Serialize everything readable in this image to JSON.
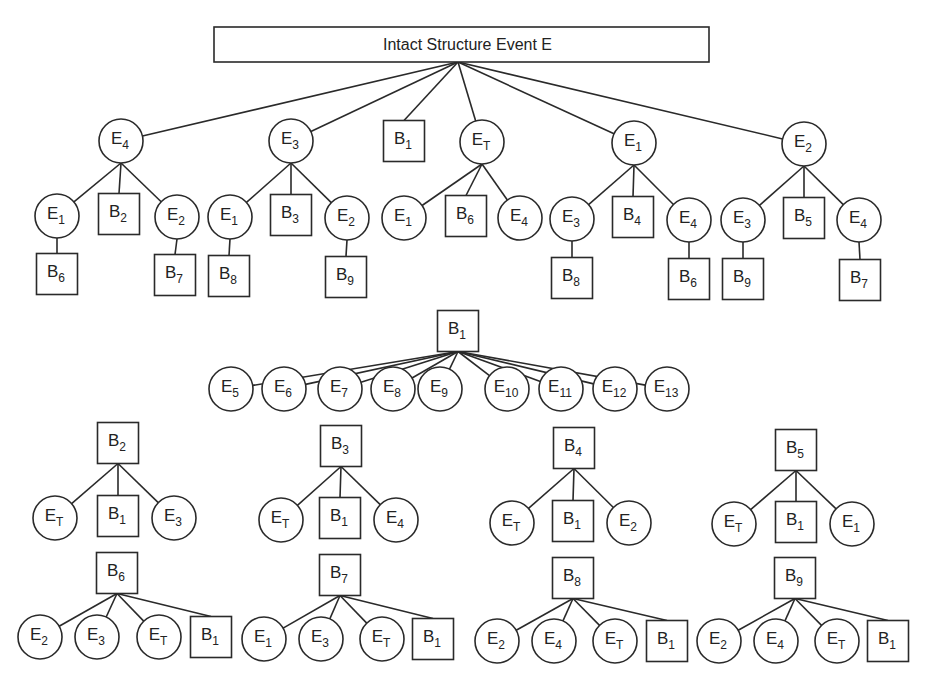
{
  "title": "Intact Structure Event E",
  "colors": {
    "stroke": "#2a2a2a",
    "background": "#ffffff"
  },
  "root": {
    "x": 214,
    "y": 27,
    "w": 495,
    "h": 35,
    "anchor": [
      458,
      62
    ]
  },
  "nodes": [
    {
      "id": "l1_E4",
      "shape": "circle",
      "base": "E",
      "sub": "4",
      "x": 121,
      "y": 141
    },
    {
      "id": "l1_E3",
      "shape": "circle",
      "base": "E",
      "sub": "3",
      "x": 291,
      "y": 141
    },
    {
      "id": "l1_B1",
      "shape": "box",
      "base": "B",
      "sub": "1",
      "x": 404,
      "y": 141
    },
    {
      "id": "l1_ET",
      "shape": "circle",
      "base": "E",
      "sub": "T",
      "x": 482,
      "y": 142
    },
    {
      "id": "l1_E1",
      "shape": "circle",
      "base": "E",
      "sub": "1",
      "x": 634,
      "y": 143
    },
    {
      "id": "l1_E2",
      "shape": "circle",
      "base": "E",
      "sub": "2",
      "x": 804,
      "y": 144
    },
    {
      "id": "a_E1",
      "shape": "circle",
      "base": "E",
      "sub": "1",
      "x": 57,
      "y": 216
    },
    {
      "id": "a_B2",
      "shape": "box",
      "base": "B",
      "sub": "2",
      "x": 119,
      "y": 214
    },
    {
      "id": "a_E2",
      "shape": "circle",
      "base": "E",
      "sub": "2",
      "x": 177,
      "y": 217
    },
    {
      "id": "a_B6",
      "shape": "box",
      "base": "B",
      "sub": "6",
      "x": 57,
      "y": 274
    },
    {
      "id": "a_B7",
      "shape": "box",
      "base": "B",
      "sub": "7",
      "x": 175,
      "y": 275
    },
    {
      "id": "b_E1",
      "shape": "circle",
      "base": "E",
      "sub": "1",
      "x": 230,
      "y": 217
    },
    {
      "id": "b_B3",
      "shape": "box",
      "base": "B",
      "sub": "3",
      "x": 291,
      "y": 215
    },
    {
      "id": "b_E2",
      "shape": "circle",
      "base": "E",
      "sub": "2",
      "x": 347,
      "y": 218
    },
    {
      "id": "b_B8",
      "shape": "box",
      "base": "B",
      "sub": "8",
      "x": 229,
      "y": 276
    },
    {
      "id": "b_B9",
      "shape": "box",
      "base": "B",
      "sub": "9",
      "x": 346,
      "y": 277
    },
    {
      "id": "c_E1",
      "shape": "circle",
      "base": "E",
      "sub": "1",
      "x": 404,
      "y": 218
    },
    {
      "id": "c_B6",
      "shape": "box",
      "base": "B",
      "sub": "6",
      "x": 466,
      "y": 216
    },
    {
      "id": "c_E4",
      "shape": "circle",
      "base": "E",
      "sub": "4",
      "x": 520,
      "y": 218
    },
    {
      "id": "d_E3",
      "shape": "circle",
      "base": "E",
      "sub": "3",
      "x": 572,
      "y": 219
    },
    {
      "id": "d_B4",
      "shape": "box",
      "base": "B",
      "sub": "4",
      "x": 633,
      "y": 217
    },
    {
      "id": "d_E4",
      "shape": "circle",
      "base": "E",
      "sub": "4",
      "x": 689,
      "y": 220
    },
    {
      "id": "d_B8",
      "shape": "box",
      "base": "B",
      "sub": "8",
      "x": 572,
      "y": 278
    },
    {
      "id": "d_B6",
      "shape": "box",
      "base": "B",
      "sub": "6",
      "x": 689,
      "y": 279
    },
    {
      "id": "e_E3",
      "shape": "circle",
      "base": "E",
      "sub": "3",
      "x": 743,
      "y": 220
    },
    {
      "id": "e_B5",
      "shape": "box",
      "base": "B",
      "sub": "5",
      "x": 804,
      "y": 218
    },
    {
      "id": "e_E4",
      "shape": "circle",
      "base": "E",
      "sub": "4",
      "x": 859,
      "y": 220
    },
    {
      "id": "e_B9",
      "shape": "box",
      "base": "B",
      "sub": "9",
      "x": 743,
      "y": 279
    },
    {
      "id": "e_B7",
      "shape": "box",
      "base": "B",
      "sub": "7",
      "x": 860,
      "y": 280
    },
    {
      "id": "f_B1",
      "shape": "box",
      "base": "B",
      "sub": "1",
      "x": 458,
      "y": 331
    },
    {
      "id": "f_E5",
      "shape": "circle",
      "base": "E",
      "sub": "5",
      "x": 231,
      "y": 389
    },
    {
      "id": "f_E6",
      "shape": "circle",
      "base": "E",
      "sub": "6",
      "x": 284,
      "y": 389
    },
    {
      "id": "f_E7",
      "shape": "circle",
      "base": "E",
      "sub": "7",
      "x": 340,
      "y": 389
    },
    {
      "id": "f_E8",
      "shape": "circle",
      "base": "E",
      "sub": "8",
      "x": 393,
      "y": 389
    },
    {
      "id": "f_E9",
      "shape": "circle",
      "base": "E",
      "sub": "9",
      "x": 440,
      "y": 389
    },
    {
      "id": "f_E10",
      "shape": "circle",
      "base": "E",
      "sub": "10",
      "x": 507,
      "y": 389
    },
    {
      "id": "f_E11",
      "shape": "circle",
      "base": "E",
      "sub": "11",
      "x": 561,
      "y": 389
    },
    {
      "id": "f_E12",
      "shape": "circle",
      "base": "E",
      "sub": "12",
      "x": 615,
      "y": 389
    },
    {
      "id": "f_E13",
      "shape": "circle",
      "base": "E",
      "sub": "13",
      "x": 667,
      "y": 389
    },
    {
      "id": "g_B2",
      "shape": "box",
      "base": "B",
      "sub": "2",
      "x": 118,
      "y": 443
    },
    {
      "id": "g_ET",
      "shape": "circle",
      "base": "E",
      "sub": "T",
      "x": 55,
      "y": 518
    },
    {
      "id": "g_B1",
      "shape": "box",
      "base": "B",
      "sub": "1",
      "x": 118,
      "y": 516
    },
    {
      "id": "g_E3",
      "shape": "circle",
      "base": "E",
      "sub": "3",
      "x": 174,
      "y": 518
    },
    {
      "id": "h_B3",
      "shape": "box",
      "base": "B",
      "sub": "3",
      "x": 341,
      "y": 446
    },
    {
      "id": "h_ET",
      "shape": "circle",
      "base": "E",
      "sub": "T",
      "x": 281,
      "y": 520
    },
    {
      "id": "h_B1",
      "shape": "box",
      "base": "B",
      "sub": "1",
      "x": 340,
      "y": 518
    },
    {
      "id": "h_E4",
      "shape": "circle",
      "base": "E",
      "sub": "4",
      "x": 396,
      "y": 520
    },
    {
      "id": "i_B4",
      "shape": "box",
      "base": "B",
      "sub": "4",
      "x": 574,
      "y": 448
    },
    {
      "id": "i_ET",
      "shape": "circle",
      "base": "E",
      "sub": "T",
      "x": 512,
      "y": 523
    },
    {
      "id": "i_B1",
      "shape": "box",
      "base": "B",
      "sub": "1",
      "x": 573,
      "y": 521
    },
    {
      "id": "i_E2",
      "shape": "circle",
      "base": "E",
      "sub": "2",
      "x": 629,
      "y": 523
    },
    {
      "id": "j_B5",
      "shape": "box",
      "base": "B",
      "sub": "5",
      "x": 796,
      "y": 450
    },
    {
      "id": "j_ET",
      "shape": "circle",
      "base": "E",
      "sub": "T",
      "x": 734,
      "y": 524
    },
    {
      "id": "j_B1",
      "shape": "box",
      "base": "B",
      "sub": "1",
      "x": 796,
      "y": 522
    },
    {
      "id": "j_E1",
      "shape": "circle",
      "base": "E",
      "sub": "1",
      "x": 852,
      "y": 524
    },
    {
      "id": "k_B6",
      "shape": "box",
      "base": "B",
      "sub": "6",
      "x": 117,
      "y": 573
    },
    {
      "id": "k_E2",
      "shape": "circle",
      "base": "E",
      "sub": "2",
      "x": 40,
      "y": 637
    },
    {
      "id": "k_E3",
      "shape": "circle",
      "base": "E",
      "sub": "3",
      "x": 97,
      "y": 637
    },
    {
      "id": "k_ET",
      "shape": "circle",
      "base": "E",
      "sub": "T",
      "x": 159,
      "y": 637
    },
    {
      "id": "k_B1",
      "shape": "box",
      "base": "B",
      "sub": "1",
      "x": 211,
      "y": 637
    },
    {
      "id": "l_B7",
      "shape": "box",
      "base": "B",
      "sub": "7",
      "x": 340,
      "y": 575
    },
    {
      "id": "l_E1",
      "shape": "circle",
      "base": "E",
      "sub": "1",
      "x": 264,
      "y": 639
    },
    {
      "id": "l_E3",
      "shape": "circle",
      "base": "E",
      "sub": "3",
      "x": 321,
      "y": 639
    },
    {
      "id": "l_ET",
      "shape": "circle",
      "base": "E",
      "sub": "T",
      "x": 382,
      "y": 639
    },
    {
      "id": "l_B1",
      "shape": "box",
      "base": "B",
      "sub": "1",
      "x": 433,
      "y": 639
    },
    {
      "id": "m_B8",
      "shape": "box",
      "base": "B",
      "sub": "8",
      "x": 573,
      "y": 578
    },
    {
      "id": "m_E2",
      "shape": "circle",
      "base": "E",
      "sub": "2",
      "x": 497,
      "y": 641
    },
    {
      "id": "m_E4",
      "shape": "circle",
      "base": "E",
      "sub": "4",
      "x": 554,
      "y": 641
    },
    {
      "id": "m_ET",
      "shape": "circle",
      "base": "E",
      "sub": "T",
      "x": 615,
      "y": 641
    },
    {
      "id": "m_B1",
      "shape": "box",
      "base": "B",
      "sub": "1",
      "x": 667,
      "y": 641
    },
    {
      "id": "n_B9",
      "shape": "box",
      "base": "B",
      "sub": "9",
      "x": 795,
      "y": 578
    },
    {
      "id": "n_E2",
      "shape": "circle",
      "base": "E",
      "sub": "2",
      "x": 719,
      "y": 641
    },
    {
      "id": "n_E4",
      "shape": "circle",
      "base": "E",
      "sub": "4",
      "x": 776,
      "y": 641
    },
    {
      "id": "n_ET",
      "shape": "circle",
      "base": "E",
      "sub": "T",
      "x": 837,
      "y": 641
    },
    {
      "id": "n_B1",
      "shape": "box",
      "base": "B",
      "sub": "1",
      "x": 888,
      "y": 641
    }
  ],
  "edges": [
    [
      "root",
      "l1_E4"
    ],
    [
      "root",
      "l1_E3"
    ],
    [
      "root",
      "l1_B1"
    ],
    [
      "root",
      "l1_ET"
    ],
    [
      "root",
      "l1_E1"
    ],
    [
      "root",
      "l1_E2"
    ],
    [
      "l1_E4",
      "a_E1"
    ],
    [
      "l1_E4",
      "a_B2"
    ],
    [
      "l1_E4",
      "a_E2"
    ],
    [
      "a_E1",
      "a_B6"
    ],
    [
      "a_E2",
      "a_B7"
    ],
    [
      "l1_E3",
      "b_E1"
    ],
    [
      "l1_E3",
      "b_B3"
    ],
    [
      "l1_E3",
      "b_E2"
    ],
    [
      "b_E1",
      "b_B8"
    ],
    [
      "b_E2",
      "b_B9"
    ],
    [
      "l1_ET",
      "c_E1"
    ],
    [
      "l1_ET",
      "c_B6"
    ],
    [
      "l1_ET",
      "c_E4"
    ],
    [
      "l1_E1",
      "d_E3"
    ],
    [
      "l1_E1",
      "d_B4"
    ],
    [
      "l1_E1",
      "d_E4"
    ],
    [
      "d_E3",
      "d_B8"
    ],
    [
      "d_E4",
      "d_B6"
    ],
    [
      "l1_E2",
      "e_E3"
    ],
    [
      "l1_E2",
      "e_B5"
    ],
    [
      "l1_E2",
      "e_E4"
    ],
    [
      "e_E3",
      "e_B9"
    ],
    [
      "e_E4",
      "e_B7"
    ],
    [
      "f_B1",
      "f_E5"
    ],
    [
      "f_B1",
      "f_E6"
    ],
    [
      "f_B1",
      "f_E7"
    ],
    [
      "f_B1",
      "f_E8"
    ],
    [
      "f_B1",
      "f_E9"
    ],
    [
      "f_B1",
      "f_E10"
    ],
    [
      "f_B1",
      "f_E11"
    ],
    [
      "f_B1",
      "f_E12"
    ],
    [
      "f_B1",
      "f_E13"
    ],
    [
      "g_B2",
      "g_ET"
    ],
    [
      "g_B2",
      "g_B1"
    ],
    [
      "g_B2",
      "g_E3"
    ],
    [
      "h_B3",
      "h_ET"
    ],
    [
      "h_B3",
      "h_B1"
    ],
    [
      "h_B3",
      "h_E4"
    ],
    [
      "i_B4",
      "i_ET"
    ],
    [
      "i_B4",
      "i_B1"
    ],
    [
      "i_B4",
      "i_E2"
    ],
    [
      "j_B5",
      "j_ET"
    ],
    [
      "j_B5",
      "j_B1"
    ],
    [
      "j_B5",
      "j_E1"
    ],
    [
      "k_B6",
      "k_E2"
    ],
    [
      "k_B6",
      "k_E3"
    ],
    [
      "k_B6",
      "k_ET"
    ],
    [
      "k_B6",
      "k_B1"
    ],
    [
      "l_B7",
      "l_E1"
    ],
    [
      "l_B7",
      "l_E3"
    ],
    [
      "l_B7",
      "l_ET"
    ],
    [
      "l_B7",
      "l_B1"
    ],
    [
      "m_B8",
      "m_E2"
    ],
    [
      "m_B8",
      "m_E4"
    ],
    [
      "m_B8",
      "m_ET"
    ],
    [
      "m_B8",
      "m_B1"
    ],
    [
      "n_B9",
      "n_E2"
    ],
    [
      "n_B9",
      "n_E4"
    ],
    [
      "n_B9",
      "n_ET"
    ],
    [
      "n_B9",
      "n_B1"
    ]
  ],
  "sizes": {
    "circle_r": 22,
    "box_half": 20.5
  }
}
